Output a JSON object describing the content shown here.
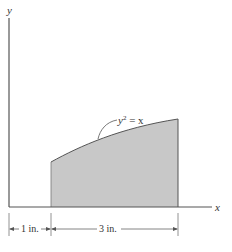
{
  "figure": {
    "type": "area-under-curve diagram",
    "axes": {
      "x_label": "x",
      "y_label": "y"
    },
    "curve": {
      "equation_lhs": "y",
      "equation_exp": "2",
      "equation_rhs": " = x"
    },
    "region": {
      "fill_color": "#c8c8c8",
      "stroke_color": "#555555"
    },
    "dimensions": [
      {
        "label": "1 in.",
        "from_in": 0,
        "to_in": 1
      },
      {
        "label": "3 in.",
        "from_in": 1,
        "to_in": 4
      }
    ]
  }
}
